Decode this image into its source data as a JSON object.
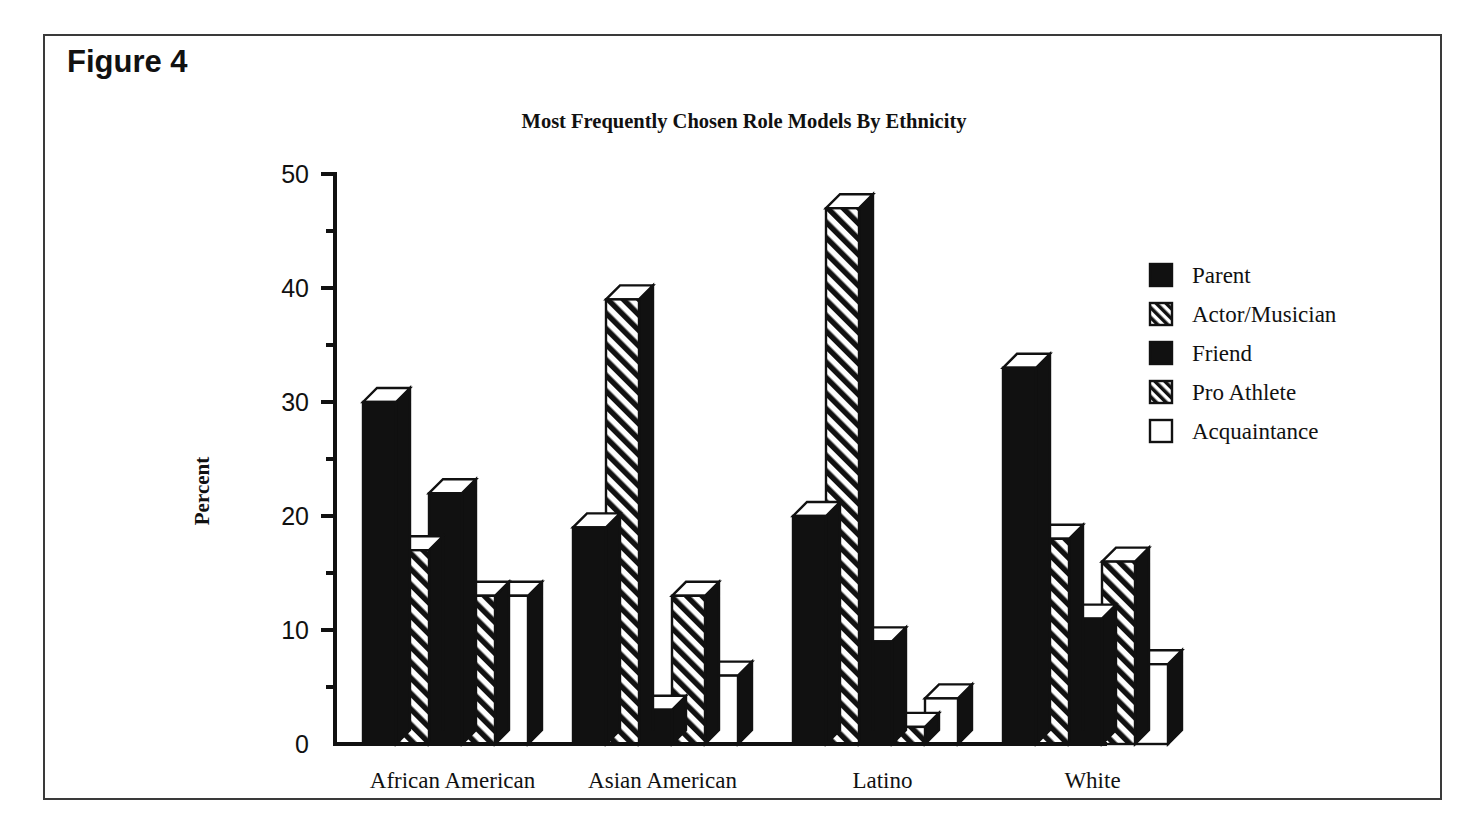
{
  "figure": {
    "label": "Figure 4"
  },
  "chart_data": {
    "type": "bar",
    "title": "Most Frequently Chosen Role Models By Ethnicity",
    "xlabel": "",
    "ylabel": "Percent",
    "ylim": [
      0,
      50
    ],
    "yticks": [
      0,
      10,
      20,
      30,
      40,
      50
    ],
    "ytick_labels": [
      "0",
      "10",
      "20",
      "30",
      "40",
      "50"
    ],
    "minor_tick_interval": 5,
    "grid": false,
    "legend_position": "right",
    "style": "3d-bars",
    "categories": [
      "African American",
      "Asian American",
      "Latino",
      "White"
    ],
    "series": [
      {
        "name": "Parent",
        "fill": "solid",
        "values": [
          30,
          19,
          20,
          33
        ]
      },
      {
        "name": "Actor/Musician",
        "fill": "hatch",
        "values": [
          17,
          39,
          47,
          18
        ]
      },
      {
        "name": "Friend",
        "fill": "solid",
        "values": [
          22,
          3,
          9,
          11
        ]
      },
      {
        "name": "Pro Athlete",
        "fill": "hatch",
        "values": [
          13,
          13,
          1.5,
          16
        ]
      },
      {
        "name": "Acquaintance",
        "fill": "empty",
        "values": [
          13,
          6,
          4,
          7
        ]
      }
    ]
  },
  "colors": {
    "solid": "#111111",
    "empty": "#ffffff",
    "outline": "#111111",
    "background": "#ffffff",
    "frame": "#3a3a3a"
  },
  "legend": {
    "items": [
      {
        "label": "Parent",
        "fill": "solid"
      },
      {
        "label": "Actor/Musician",
        "fill": "hatch"
      },
      {
        "label": "Friend",
        "fill": "solid"
      },
      {
        "label": "Pro Athlete",
        "fill": "hatch"
      },
      {
        "label": "Acquaintance",
        "fill": "empty"
      }
    ]
  }
}
